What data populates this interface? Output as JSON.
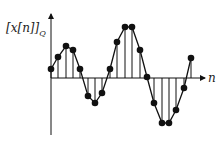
{
  "y_label": "[x[n]]",
  "y_label_sub": "Q",
  "x_label": "n",
  "colors": {
    "line": "#111111",
    "bg": "#ffffff"
  },
  "chart_data": {
    "type": "stem",
    "title": "",
    "xlabel": "n",
    "ylabel": "[x[n]]_Q",
    "x": [
      0,
      1,
      2,
      3,
      4,
      5,
      6,
      7,
      8,
      9,
      10,
      11,
      12,
      13,
      14,
      15,
      16,
      17,
      18,
      19
    ],
    "values": [
      1,
      2,
      3,
      2.6,
      1,
      -1.8,
      -2.4,
      -1.4,
      1,
      3.4,
      4.8,
      4.8,
      2.6,
      0.1,
      -2.4,
      -4.4,
      -4.4,
      -3.2,
      -1,
      1.9
    ],
    "px": [
      [
        51,
        69
      ],
      [
        58,
        57
      ],
      [
        66,
        46
      ],
      [
        73,
        50
      ],
      [
        80,
        69
      ],
      [
        88,
        96
      ],
      [
        95,
        103
      ],
      [
        102,
        93
      ],
      [
        110,
        69
      ],
      [
        117,
        42
      ],
      [
        125,
        27
      ],
      [
        132,
        27
      ],
      [
        140,
        50
      ],
      [
        147,
        77
      ],
      [
        154,
        103
      ],
      [
        162,
        123
      ],
      [
        169,
        123
      ],
      [
        176,
        110
      ],
      [
        184,
        88
      ],
      [
        191,
        58
      ]
    ],
    "connected_envelope": true,
    "grid": false
  }
}
